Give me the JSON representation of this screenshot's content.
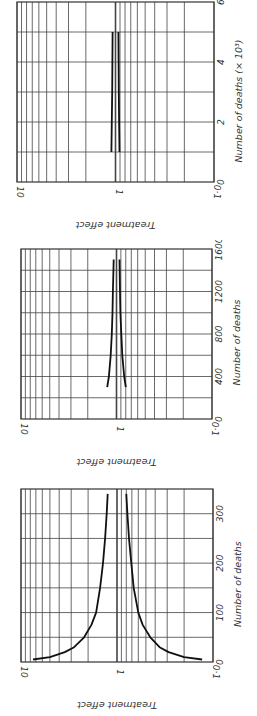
{
  "figure": {
    "orientation": "rotated 90 degrees; read with page turned",
    "y_axis_label": "Treatment effect",
    "y_ticks": [
      "10",
      "1",
      "0·1"
    ]
  },
  "chart_data": [
    {
      "type": "line",
      "title": "",
      "xlabel": "Number of deaths (× 10³)",
      "ylabel": "Treatment effect",
      "yscale": "log",
      "ylim": [
        0.1,
        10
      ],
      "xlim": [
        0,
        6
      ],
      "xticks": [
        "0",
        "2",
        "4",
        "6"
      ],
      "yticks": [
        "10",
        "1",
        "0·1"
      ],
      "grid": true,
      "series": [
        {
          "name": "upper boundary",
          "x": [
            1,
            2,
            3,
            4,
            5
          ],
          "values": [
            1.1,
            1.09,
            1.08,
            1.075,
            1.07
          ]
        },
        {
          "name": "lower boundary",
          "x": [
            1,
            2,
            3,
            4,
            5
          ],
          "values": [
            0.91,
            0.92,
            0.925,
            0.93,
            0.935
          ]
        }
      ]
    },
    {
      "type": "line",
      "title": "",
      "xlabel": "Number of deaths",
      "ylabel": "Treatment effect",
      "yscale": "log",
      "ylim": [
        0.1,
        10
      ],
      "xlim": [
        0,
        1600
      ],
      "xticks": [
        "0",
        "400",
        "800",
        "1200",
        "1600"
      ],
      "yticks": [
        "10",
        "1",
        "0·1"
      ],
      "grid": true,
      "series": [
        {
          "name": "upper boundary",
          "x": [
            300,
            400,
            600,
            800,
            1000,
            1200,
            1500
          ],
          "values": [
            1.25,
            1.2,
            1.15,
            1.12,
            1.1,
            1.09,
            1.07
          ]
        },
        {
          "name": "lower boundary",
          "x": [
            300,
            400,
            600,
            800,
            1000,
            1200,
            1500
          ],
          "values": [
            0.8,
            0.83,
            0.87,
            0.89,
            0.91,
            0.92,
            0.93
          ]
        }
      ]
    },
    {
      "type": "line",
      "title": "",
      "xlabel": "Number of deaths",
      "ylabel": "Treatment effect",
      "yscale": "log",
      "ylim": [
        0.1,
        10
      ],
      "xlim": [
        0,
        350
      ],
      "xticks": [
        "0",
        "100",
        "200",
        "300"
      ],
      "yticks": [
        "10",
        "1",
        "0·1"
      ],
      "grid": true,
      "series": [
        {
          "name": "upper boundary",
          "x": [
            5,
            10,
            20,
            30,
            50,
            75,
            100,
            150,
            200,
            250,
            300,
            340
          ],
          "values": [
            7.5,
            5.0,
            3.5,
            2.8,
            2.2,
            1.85,
            1.65,
            1.5,
            1.4,
            1.33,
            1.28,
            1.25
          ]
        },
        {
          "name": "lower boundary",
          "x": [
            5,
            10,
            20,
            30,
            50,
            75,
            100,
            150,
            200,
            250,
            300,
            340
          ],
          "values": [
            0.13,
            0.2,
            0.29,
            0.36,
            0.45,
            0.54,
            0.6,
            0.67,
            0.71,
            0.75,
            0.78,
            0.8
          ]
        }
      ]
    }
  ]
}
